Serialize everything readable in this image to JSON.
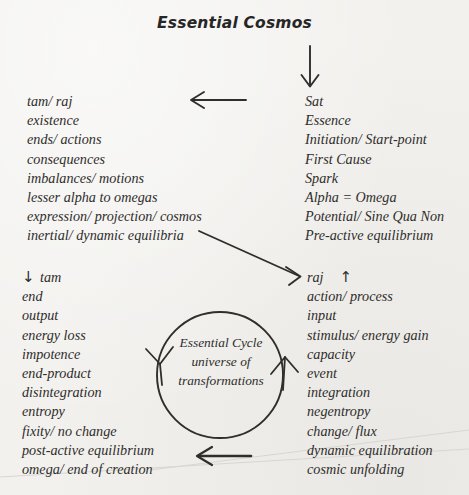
{
  "title": "Essential Cosmos",
  "background_color": "#f2f1ee",
  "ink_color": "#2f2e2c",
  "columns": {
    "top_left": {
      "name": "tam-raj-manifestation-column",
      "lines": [
        "tam/ raj",
        "existence",
        "ends/ actions",
        "consequences",
        "imbalances/ motions",
        "lesser alpha to omegas",
        "expression/ projection/ cosmos",
        "inertial/ dynamic equilibria"
      ]
    },
    "top_right": {
      "name": "sat-essence-column",
      "lines": [
        "Sat",
        "Essence",
        "Initiation/ Start-point",
        "First Cause",
        "Spark",
        "Alpha = Omega",
        "Potential/ Sine Qua Non",
        "Pre-active equilibrium"
      ]
    },
    "bottom_left": {
      "name": "tam-entropy-column",
      "arrow": "↓",
      "lines": [
        "tam",
        "end",
        "output",
        "energy loss",
        "impotence",
        "end-product",
        "disintegration",
        "entropy",
        "fixity/ no change",
        "post-active equilibrium",
        "omega/ end of creation"
      ]
    },
    "bottom_right": {
      "name": "raj-action-column",
      "arrow": "↑",
      "lines": [
        "raj",
        "action/ process",
        "input",
        "stimulus/ energy gain",
        "capacity",
        "event",
        "integration",
        "negentropy",
        "change/ flux",
        "dynamic equilibration",
        "cosmic unfolding"
      ]
    }
  },
  "cycle": {
    "line1": "Essential Cycle",
    "line2": "universe of",
    "line3": "transformations"
  },
  "arrows": [
    {
      "name": "arrow-down-title-to-sat",
      "direction": "down"
    },
    {
      "name": "arrow-left-sat-to-tamraj",
      "direction": "left"
    },
    {
      "name": "arrow-diagonal-equilibria-to-raj",
      "direction": "down-right"
    },
    {
      "name": "arrow-left-cosmic-to-omega",
      "direction": "left"
    },
    {
      "name": "arrowhead-cycle-left-descending",
      "direction": "down-left"
    },
    {
      "name": "arrowhead-cycle-right-ascending",
      "direction": "up"
    }
  ]
}
